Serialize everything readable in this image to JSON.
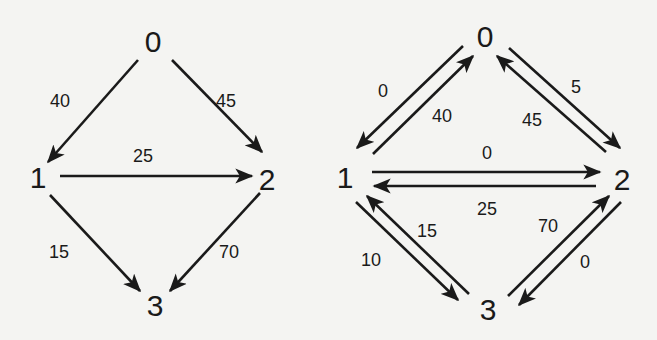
{
  "diagrams": [
    {
      "name": "flow-network",
      "nodes": [
        {
          "id": "0",
          "label": "0",
          "x": 153,
          "y": 52
        },
        {
          "id": "1",
          "label": "1",
          "x": 38,
          "y": 188
        },
        {
          "id": "2",
          "label": "2",
          "x": 267,
          "y": 190
        },
        {
          "id": "3",
          "label": "3",
          "x": 155,
          "y": 316
        }
      ],
      "edges": [
        {
          "from": "0",
          "to": "1",
          "label": "40",
          "x1": 138,
          "y1": 60,
          "x2": 48,
          "y2": 162,
          "lx": 60,
          "ly": 107
        },
        {
          "from": "0",
          "to": "2",
          "label": "45",
          "x1": 172,
          "y1": 60,
          "x2": 262,
          "y2": 152,
          "lx": 226,
          "ly": 107
        },
        {
          "from": "1",
          "to": "2",
          "label": "25",
          "x1": 60,
          "y1": 176,
          "x2": 252,
          "y2": 176,
          "lx": 143,
          "ly": 162
        },
        {
          "from": "1",
          "to": "3",
          "label": "15",
          "x1": 50,
          "y1": 195,
          "x2": 140,
          "y2": 291,
          "lx": 59,
          "ly": 258
        },
        {
          "from": "2",
          "to": "3",
          "label": "70",
          "x1": 260,
          "y1": 193,
          "x2": 170,
          "y2": 291,
          "lx": 229,
          "ly": 258
        }
      ]
    },
    {
      "name": "residual-network",
      "nodes": [
        {
          "id": "0",
          "label": "0",
          "x": 485,
          "y": 47
        },
        {
          "id": "1",
          "label": "1",
          "x": 345,
          "y": 188
        },
        {
          "id": "2",
          "label": "2",
          "x": 622,
          "y": 190
        },
        {
          "id": "3",
          "label": "3",
          "x": 488,
          "y": 320
        }
      ],
      "edges": [
        {
          "from": "0",
          "to": "1",
          "label": "0",
          "x1": 463,
          "y1": 46,
          "x2": 357,
          "y2": 148,
          "lx": 383,
          "ly": 97
        },
        {
          "from": "1",
          "to": "0",
          "label": "40",
          "x1": 373,
          "y1": 154,
          "x2": 473,
          "y2": 56,
          "lx": 442,
          "ly": 122
        },
        {
          "from": "0",
          "to": "2",
          "label": "5",
          "x1": 509,
          "y1": 48,
          "x2": 620,
          "y2": 148,
          "lx": 576,
          "ly": 93
        },
        {
          "from": "2",
          "to": "0",
          "label": "45",
          "x1": 606,
          "y1": 152,
          "x2": 497,
          "y2": 56,
          "lx": 532,
          "ly": 126
        },
        {
          "from": "1",
          "to": "2",
          "label": "0",
          "x1": 372,
          "y1": 172,
          "x2": 600,
          "y2": 172,
          "lx": 487,
          "ly": 159
        },
        {
          "from": "2",
          "to": "1",
          "label": "25",
          "x1": 596,
          "y1": 186,
          "x2": 374,
          "y2": 186,
          "lx": 487,
          "ly": 215
        },
        {
          "from": "1",
          "to": "3",
          "label": "10",
          "x1": 356,
          "y1": 202,
          "x2": 458,
          "y2": 300,
          "lx": 371,
          "ly": 266
        },
        {
          "from": "3",
          "to": "1",
          "label": "15",
          "x1": 469,
          "y1": 294,
          "x2": 367,
          "y2": 196,
          "lx": 427,
          "ly": 237
        },
        {
          "from": "3",
          "to": "2",
          "label": "70",
          "x1": 508,
          "y1": 296,
          "x2": 609,
          "y2": 196,
          "lx": 548,
          "ly": 232
        },
        {
          "from": "2",
          "to": "3",
          "label": "0",
          "x1": 621,
          "y1": 202,
          "x2": 519,
          "y2": 305,
          "lx": 585,
          "ly": 268
        }
      ]
    }
  ]
}
